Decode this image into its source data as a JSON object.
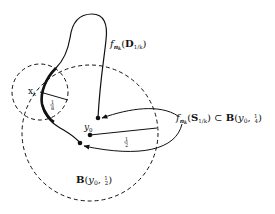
{
  "diagram": {
    "labels": {
      "image_set": {
        "f": "f",
        "sub": "n",
        "subsub": "k",
        "open": "(",
        "set": "D",
        "setsub": "1/k",
        "close": ")"
      },
      "sphere_map": {
        "f": "f",
        "sub": "n",
        "subsub": "k",
        "open": "(",
        "set": "S",
        "setsub": "1/k",
        "close": ")",
        "rel": " ⊂ ",
        "ball": "B",
        "args_open": "(",
        "center": "y",
        "center_sub": "0",
        "comma": ", ",
        "num": "1",
        "den": "4",
        "args_close": ")"
      },
      "big_ball": {
        "ball": "B",
        "args_open": "(",
        "center": "y",
        "center_sub": "0",
        "comma": ", ",
        "num": "1",
        "den": "2",
        "args_close": ")"
      },
      "xk": {
        "x": "x",
        "sub": "k"
      },
      "y0": {
        "y": "y",
        "sub": "0"
      },
      "radius_big": {
        "num": "1",
        "den": "2"
      },
      "radius_small": {
        "num": "1",
        "den": "8"
      }
    },
    "colors": {
      "ink": "#111111",
      "background": "#ffffff"
    }
  }
}
